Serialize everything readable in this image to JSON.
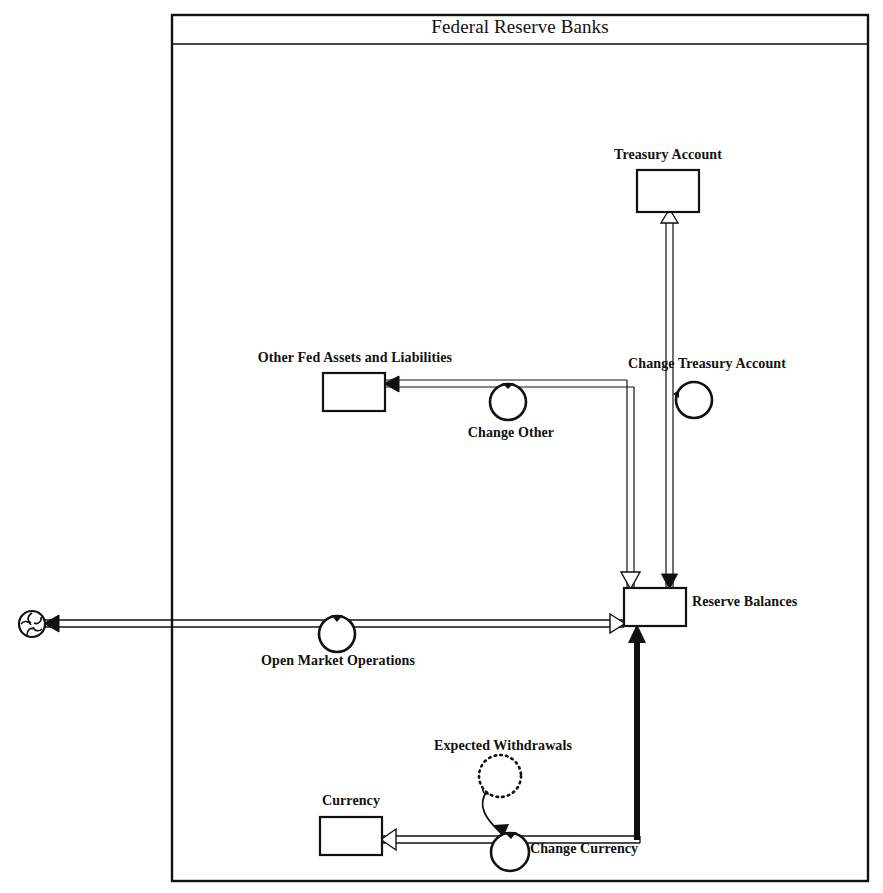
{
  "diagram": {
    "title": "Federal Reserve Banks",
    "type": "stock-and-flow",
    "frame": {
      "x": 172,
      "y": 15,
      "width": 696,
      "height": 866,
      "title_divider_y": 44
    }
  },
  "stocks": [
    {
      "id": "treasury-account",
      "label": "Treasury Account",
      "label_x": 668,
      "label_y": 155,
      "box": {
        "x": 637,
        "y": 170,
        "width": 62,
        "height": 42
      }
    },
    {
      "id": "other-fed-assets-and-liabilities",
      "label": "Other Fed Assets and Liabilities",
      "label_x": 355,
      "label_y": 358,
      "box": {
        "x": 323,
        "y": 373,
        "width": 62,
        "height": 38
      }
    },
    {
      "id": "reserve-balances",
      "label": "Reserve Balances",
      "label_x": 694,
      "label_y": 600,
      "box": {
        "x": 624,
        "y": 588,
        "width": 62,
        "height": 38
      }
    },
    {
      "id": "currency",
      "label": "Currency",
      "label_x": 351,
      "label_y": 802,
      "box": {
        "x": 320,
        "y": 817,
        "width": 62,
        "height": 38
      }
    }
  ],
  "flows": [
    {
      "id": "change-treasury-account",
      "label": "Change Treasury Account",
      "label_x": 707,
      "label_y": 365,
      "valve": {
        "cx": 694,
        "cy": 400,
        "r": 18
      },
      "from": "reserve-balances",
      "to": "treasury-account"
    },
    {
      "id": "change-other",
      "label": "Change Other",
      "label_x": 511,
      "label_y": 434,
      "valve": {
        "cx": 508,
        "cy": 402,
        "r": 18
      },
      "from": "reserve-balances",
      "to": "other-fed-assets-and-liabilities"
    },
    {
      "id": "open-market-operations",
      "label": "Open Market Operations",
      "label_x": 338,
      "label_y": 662,
      "valve": {
        "cx": 337,
        "cy": 634,
        "r": 18
      },
      "from": "source-cloud",
      "to": "reserve-balances"
    },
    {
      "id": "change-currency",
      "label": "Change Currency",
      "label_x": 586,
      "label_y": 850,
      "valve": {
        "cx": 510,
        "cy": 852,
        "r": 19
      },
      "from": "reserve-balances",
      "to": "currency"
    }
  ],
  "auxiliaries": [
    {
      "id": "expected-withdrawals",
      "label": "Expected Withdrawals",
      "label_x": 503,
      "label_y": 747,
      "circle": {
        "cx": 500,
        "cy": 776,
        "r": 21
      },
      "style": "dotted",
      "influences": "change-currency"
    }
  ],
  "sources": [
    {
      "id": "source-cloud",
      "label": "",
      "cx": 32,
      "cy": 624,
      "r": 13
    }
  ],
  "colors": {
    "line": "#111111",
    "background": "#ffffff",
    "pipe_fill": "#ffffff"
  }
}
